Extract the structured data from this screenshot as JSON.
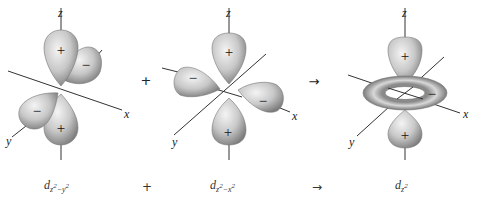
{
  "figure": {
    "panels": [
      {
        "id": "dz2_minus_y2",
        "caption": {
          "base": "d",
          "sub1": "z",
          "sup1": "2",
          "minus": "−",
          "sub2": "y",
          "sup2": "2"
        },
        "axes": {
          "z": "z",
          "x": "x",
          "y": "y"
        },
        "lobes": [
          {
            "position": "upper-z",
            "sign": "+"
          },
          {
            "position": "upper-y-back",
            "sign": "−"
          },
          {
            "position": "lower-y-front",
            "sign": "−"
          },
          {
            "position": "lower-z",
            "sign": "+"
          }
        ]
      },
      {
        "id": "dz2_minus_x2",
        "caption": {
          "base": "d",
          "sub1": "z",
          "sup1": "2",
          "minus": "−",
          "sub2": "x",
          "sup2": "2"
        },
        "axes": {
          "z": "z",
          "x": "x",
          "y": "y"
        },
        "lobes": [
          {
            "position": "upper-z",
            "sign": "+"
          },
          {
            "position": "left-x",
            "sign": "−"
          },
          {
            "position": "right-x",
            "sign": "−"
          },
          {
            "position": "lower-z",
            "sign": "+"
          }
        ]
      },
      {
        "id": "dz2",
        "caption": {
          "base": "d",
          "sub1": "z",
          "sup1": "2"
        },
        "axes": {
          "z": "z",
          "x": "x",
          "y": "y"
        },
        "lobes": [
          {
            "position": "upper-z",
            "sign": "+"
          },
          {
            "position": "torus-xy",
            "sign": "−"
          },
          {
            "position": "lower-z",
            "sign": "+"
          }
        ]
      }
    ],
    "operators": {
      "plus": "+",
      "arrow": "→"
    },
    "colors": {
      "lobe_light": "#f2f2f2",
      "lobe_mid": "#bdbdbd",
      "lobe_dark": "#7a7a7a",
      "axis": "#333333"
    }
  }
}
